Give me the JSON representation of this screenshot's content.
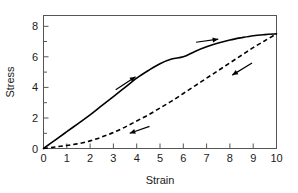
{
  "chart_data": {
    "type": "line",
    "title": "",
    "xlabel": "Strain",
    "ylabel": "Stress",
    "xlim": [
      0,
      10
    ],
    "ylim": [
      0,
      8.7
    ],
    "grid": false,
    "legend": "none",
    "x_ticks": [
      "0",
      "1",
      "2",
      "3",
      "4",
      "5",
      "6",
      "7",
      "8",
      "9",
      "10"
    ],
    "x_tick_values": [
      0,
      1,
      2,
      3,
      4,
      5,
      6,
      7,
      8,
      9,
      10
    ],
    "y_ticks": [
      "0",
      "2",
      "4",
      "6",
      "8"
    ],
    "y_tick_values": [
      0,
      2,
      4,
      6,
      8
    ],
    "y_minor_tick_values": [
      1,
      3,
      5,
      7
    ],
    "series": [
      {
        "name": "Loading (solid)",
        "style": "solid",
        "color": "#000000",
        "x": [
          0,
          0.5,
          1,
          1.5,
          2,
          2.5,
          3,
          3.5,
          4,
          4.5,
          5,
          5.5,
          6,
          6.5,
          7,
          7.5,
          8,
          8.5,
          9,
          9.5,
          10
        ],
        "y": [
          0,
          0.55,
          1.1,
          1.65,
          2.2,
          2.8,
          3.4,
          4.0,
          4.6,
          5.1,
          5.55,
          5.85,
          6.0,
          6.35,
          6.65,
          6.9,
          7.1,
          7.25,
          7.38,
          7.45,
          7.5
        ]
      },
      {
        "name": "Unloading (dashed)",
        "style": "dashed",
        "color": "#000000",
        "x": [
          0,
          0.5,
          1,
          1.5,
          2,
          2.5,
          3,
          3.5,
          4,
          4.5,
          5,
          5.5,
          6,
          6.5,
          7,
          7.5,
          8,
          8.5,
          9,
          9.5,
          10
        ],
        "y": [
          0,
          0.1,
          0.2,
          0.32,
          0.5,
          0.75,
          1.05,
          1.4,
          1.8,
          2.2,
          2.65,
          3.1,
          3.6,
          4.1,
          4.6,
          5.1,
          5.6,
          6.1,
          6.6,
          7.05,
          7.5
        ]
      }
    ],
    "annotations": [
      {
        "name": "loading-arrow-lower",
        "kind": "arrow",
        "x": 3.1,
        "y": 3.85,
        "dx": 0.85,
        "dy": 0.85,
        "direction": "up-right",
        "series": "Loading (solid)"
      },
      {
        "name": "loading-arrow-upper",
        "kind": "arrow",
        "x": 6.55,
        "y": 6.95,
        "dx": 0.95,
        "dy": 0.2,
        "direction": "right",
        "series": "Loading (solid)"
      },
      {
        "name": "unloading-arrow-lower",
        "kind": "arrow",
        "x": 4.55,
        "y": 1.45,
        "dx": -0.85,
        "dy": -0.45,
        "direction": "down-left",
        "series": "Unloading (dashed)"
      },
      {
        "name": "unloading-arrow-upper",
        "kind": "arrow",
        "x": 8.95,
        "y": 5.6,
        "dx": -0.85,
        "dy": -0.8,
        "direction": "down-left",
        "series": "Unloading (dashed)"
      }
    ]
  },
  "figure": {
    "background_color": "#ffffff",
    "axis_color": "#555555",
    "curve_color": "#000000",
    "text_color": "#1a1a1a"
  }
}
